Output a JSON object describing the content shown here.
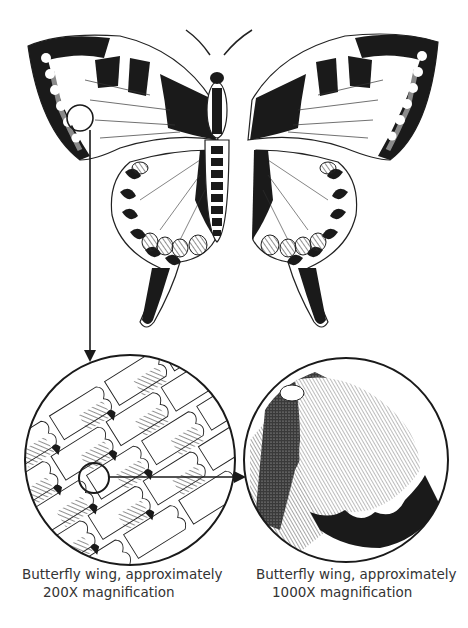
{
  "figure": {
    "butterfly": {
      "name": "butterfly-illustration"
    },
    "magnifications": [
      {
        "id": "low",
        "level": "200X",
        "caption_line1": "Butterfly wing, approximately",
        "caption_line2": "200X magnification"
      },
      {
        "id": "high",
        "level": "1000X",
        "caption_line1": "Butterfly wing, approximately",
        "caption_line2": "1000X magnification"
      }
    ],
    "colors": {
      "ink": "#1a1a1a",
      "gray_fill": "#8a8a8a",
      "caption_text": "#333333",
      "background": "#ffffff"
    }
  }
}
